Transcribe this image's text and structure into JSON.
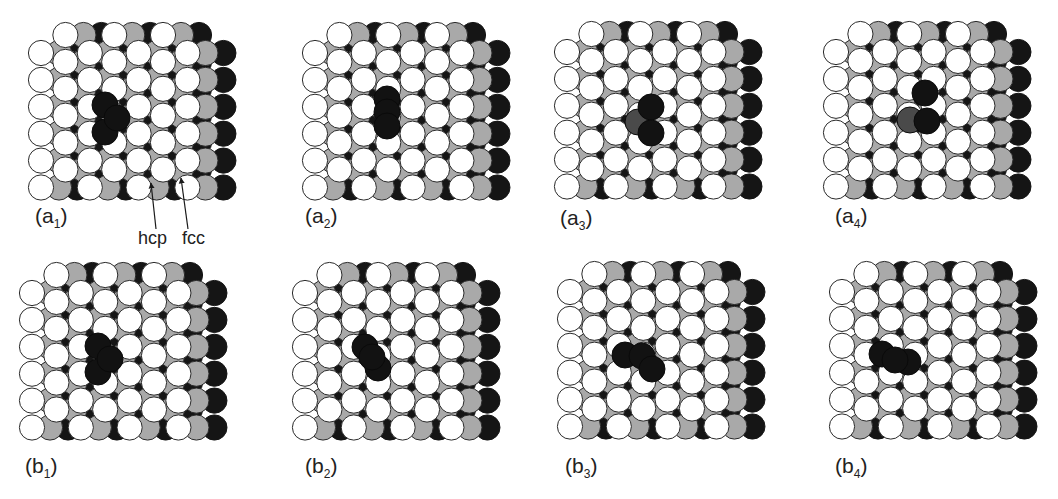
{
  "figure": {
    "lattice": {
      "columns": 7,
      "circles_per_column": 6,
      "column_spacing": 24.4,
      "row_spacing": 26.9,
      "odd_column_shift": -18,
      "radius": 12.6,
      "layer_offsets": {
        "grey": 18,
        "black": 36
      }
    },
    "colors": {
      "surface_atom": "#ffffff",
      "outline": "#2a2a2a",
      "second_layer": "#a9a9a9",
      "third_layer": "#151515",
      "adatom": "#121212",
      "adatom_dim": "#4a4a4a"
    },
    "panels": [
      {
        "id": "a1",
        "label_main": "(a",
        "label_sub": "1",
        "label_close": ")",
        "origin": [
          41,
          53
        ],
        "label_pos": [
          35,
          205
        ],
        "adatoms": [
          [
            105,
            105,
            "dark"
          ],
          [
            105,
            132,
            "dark"
          ],
          [
            117,
            118,
            "dark"
          ]
        ]
      },
      {
        "id": "a2",
        "label_main": "(a",
        "label_sub": "2",
        "label_close": ")",
        "origin": [
          315,
          53
        ],
        "label_pos": [
          305,
          205
        ],
        "adatoms": [
          [
            387,
            99,
            "dark"
          ],
          [
            387,
            112,
            "dark"
          ],
          [
            387,
            126,
            "dark"
          ]
        ]
      },
      {
        "id": "a3",
        "label_main": "(a",
        "label_sub": "3",
        "label_close": ")",
        "origin": [
          567,
          52
        ],
        "label_pos": [
          560,
          207
        ],
        "adatoms": [
          [
            638,
            122,
            "dim"
          ],
          [
            651,
            107,
            "dark"
          ],
          [
            651,
            133,
            "dark"
          ]
        ]
      },
      {
        "id": "a4",
        "label_main": "(a",
        "label_sub": "4",
        "label_close": ")",
        "origin": [
          836,
          52
        ],
        "label_pos": [
          835,
          205
        ],
        "adatoms": [
          [
            910,
            120,
            "dim"
          ],
          [
            925,
            93,
            "dark"
          ],
          [
            927,
            121,
            "dark"
          ]
        ]
      },
      {
        "id": "b1",
        "label_main": "(b",
        "label_sub": "1",
        "label_close": ")",
        "origin": [
          32,
          293
        ],
        "label_pos": [
          25,
          455
        ],
        "adatoms": [
          [
            98,
            346,
            "dark"
          ],
          [
            98,
            372,
            "dark"
          ],
          [
            110,
            359,
            "dark"
          ]
        ]
      },
      {
        "id": "b2",
        "label_main": "(b",
        "label_sub": "2",
        "label_close": ")",
        "origin": [
          305,
          293
        ],
        "label_pos": [
          305,
          455
        ],
        "adatoms": [
          [
            365,
            347,
            "dark"
          ],
          [
            378,
            368,
            "dark"
          ],
          [
            372,
            357,
            "dark"
          ]
        ]
      },
      {
        "id": "b3",
        "label_main": "(b",
        "label_sub": "3",
        "label_close": ")",
        "origin": [
          570,
          292
        ],
        "label_pos": [
          565,
          455
        ],
        "adatoms": [
          [
            625,
            355,
            "dark"
          ],
          [
            642,
            356,
            "dark"
          ],
          [
            652,
            369,
            "dark"
          ]
        ]
      },
      {
        "id": "b4",
        "label_main": "(b",
        "label_sub": "4",
        "label_close": ")",
        "origin": [
          842,
          292
        ],
        "label_pos": [
          835,
          455
        ],
        "adatoms": [
          [
            882,
            354,
            "dark"
          ],
          [
            908,
            362,
            "dark"
          ],
          [
            895,
            360,
            "dark"
          ]
        ]
      }
    ],
    "annotations": [
      {
        "id": "hcp",
        "text": "hcp",
        "pos": [
          138,
          229
        ],
        "arrow_from": [
          156,
          229
        ],
        "arrow_to": [
          151,
          183
        ]
      },
      {
        "id": "fcc",
        "text": "fcc",
        "pos": [
          182,
          229
        ],
        "arrow_from": [
          188,
          229
        ],
        "arrow_to": [
          181,
          178
        ]
      }
    ]
  }
}
